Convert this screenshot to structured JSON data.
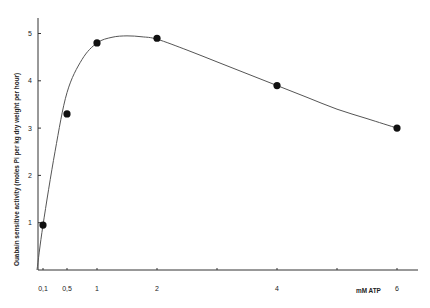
{
  "chart_data": {
    "type": "scatter",
    "title": "",
    "xlabel": "mM ATP",
    "ylabel": "Ouabain sensitive activity (moles Pi per kg dry weight per hour)",
    "xlim": [
      0,
      6.3
    ],
    "ylim": [
      0,
      5.3
    ],
    "grid": false,
    "legend": null,
    "x_ticks": [
      {
        "value": 0.1,
        "label": "0,1"
      },
      {
        "value": 0.5,
        "label": "0,5"
      },
      {
        "value": 1,
        "label": "1"
      },
      {
        "value": 2,
        "label": "2"
      },
      {
        "value": 3,
        "label": ""
      },
      {
        "value": 4,
        "label": "4"
      },
      {
        "value": 5,
        "label": ""
      },
      {
        "value": 6,
        "label": "6"
      }
    ],
    "y_ticks": [
      {
        "value": 1,
        "label": "1"
      },
      {
        "value": 2,
        "label": "2"
      },
      {
        "value": 3,
        "label": "3"
      },
      {
        "value": 4,
        "label": "4"
      },
      {
        "value": 5,
        "label": "5"
      }
    ],
    "series": [
      {
        "name": "measured",
        "marker": "filled-circle",
        "x": [
          0.1,
          0.5,
          1,
          2,
          4,
          6
        ],
        "y": [
          0.95,
          3.3,
          4.8,
          4.9,
          3.9,
          3.0
        ]
      },
      {
        "name": "fitted curve",
        "marker": "none",
        "style": "smooth line",
        "x": [
          0,
          0.1,
          0.3,
          0.5,
          0.75,
          1,
          1.25,
          1.5,
          1.75,
          2,
          2.5,
          3,
          3.5,
          4,
          4.5,
          5,
          5.5,
          6
        ],
        "y": [
          0,
          0.95,
          2.5,
          3.75,
          4.45,
          4.8,
          4.92,
          4.95,
          4.93,
          4.88,
          4.65,
          4.4,
          4.15,
          3.9,
          3.65,
          3.4,
          3.2,
          3.0
        ]
      }
    ]
  }
}
